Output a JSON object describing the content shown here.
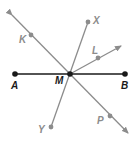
{
  "diagram": {
    "colors": {
      "primary": "#1a1a1a",
      "secondary": "#8c8c8c",
      "background": "#ffffff"
    },
    "points": [
      {
        "id": "A",
        "label": "A",
        "x": 15,
        "y": 74,
        "color": "primary",
        "label_x": 11,
        "label_y": 89
      },
      {
        "id": "B",
        "label": "B",
        "x": 125,
        "y": 74,
        "color": "primary",
        "label_x": 121,
        "label_y": 89
      },
      {
        "id": "M",
        "label": "M",
        "x": 70,
        "y": 74,
        "color": "primary",
        "label_x": 55,
        "label_y": 84
      },
      {
        "id": "K",
        "label": "K",
        "x": 31,
        "y": 35,
        "color": "secondary",
        "label_x": 19,
        "label_y": 43
      },
      {
        "id": "X",
        "label": "X",
        "x": 88,
        "y": 22,
        "color": "secondary",
        "label_x": 93,
        "label_y": 24
      },
      {
        "id": "L",
        "label": "L",
        "x": 98,
        "y": 58,
        "color": "secondary",
        "label_x": 92,
        "label_y": 54
      },
      {
        "id": "Y",
        "label": "Y",
        "x": 51,
        "y": 127,
        "color": "secondary",
        "label_x": 38,
        "label_y": 133
      },
      {
        "id": "P",
        "label": "P",
        "x": 110,
        "y": 116,
        "color": "secondary",
        "label_x": 97,
        "label_y": 124
      }
    ],
    "segments": [
      {
        "id": "segment-AB",
        "from": "A",
        "to": "B",
        "color": "primary"
      },
      {
        "id": "segment-XY",
        "from": "X",
        "to": "Y",
        "color": "secondary"
      }
    ],
    "rays": [
      {
        "id": "ray-ML",
        "from": "M",
        "through": "L",
        "tip_x": 121,
        "tip_y": 46,
        "color": "secondary"
      }
    ],
    "lines": [
      {
        "id": "line-KP",
        "start_x": 12,
        "start_y": 15,
        "end_x": 128,
        "end_y": 133,
        "color": "secondary"
      }
    ]
  }
}
